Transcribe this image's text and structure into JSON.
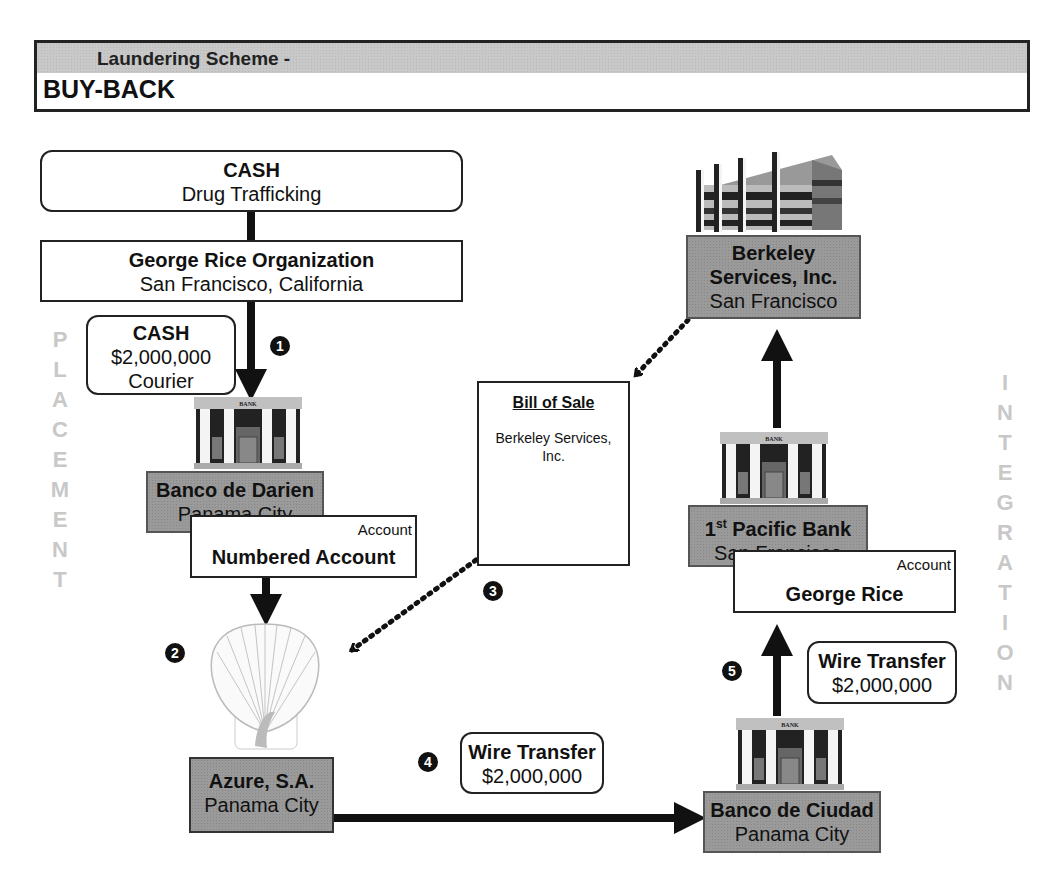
{
  "header": {
    "subtitle": "Laundering Scheme -",
    "title": "BUY-BACK"
  },
  "side_labels": {
    "left": [
      "P",
      "L",
      "A",
      "C",
      "E",
      "M",
      "E",
      "N",
      "T"
    ],
    "right": [
      "I",
      "N",
      "T",
      "E",
      "G",
      "R",
      "A",
      "T",
      "I",
      "O",
      "N"
    ],
    "left_word": "PLACEMENT",
    "right_word": "INTEGRATION"
  },
  "nodes": {
    "cash_source": {
      "title": "CASH",
      "subtitle": "Drug Trafficking"
    },
    "organization": {
      "title": "George Rice Organization",
      "subtitle": "San Francisco, California"
    },
    "cash_courier": {
      "title": "CASH",
      "amount": "$2,000,000",
      "method": "Courier"
    },
    "banco_darien": {
      "title": "Banco de Darien",
      "subtitle": "Panama City",
      "icon": "bank-building-icon"
    },
    "numbered_account": {
      "label": "Account",
      "title": "Numbered Account"
    },
    "azure": {
      "title": "Azure, S.A.",
      "subtitle": "Panama City",
      "icon": "shell-icon"
    },
    "bill_of_sale": {
      "title": "Bill of Sale",
      "body": "Berkeley Services, Inc."
    },
    "berkeley": {
      "title_line1": "Berkeley",
      "title_line2": "Services, Inc.",
      "subtitle": "San Francisco",
      "icon": "office-building-icon"
    },
    "pacific_bank": {
      "title_num": "1",
      "title_sup": "st",
      "title_rest": " Pacific Bank",
      "subtitle": "San Francisco",
      "icon": "bank-building-icon"
    },
    "george_account": {
      "label": "Account",
      "title": "George Rice"
    },
    "banco_ciudad": {
      "title": "Banco de Ciudad",
      "subtitle": "Panama City",
      "icon": "bank-building-icon"
    },
    "wire_transfer_4": {
      "title": "Wire Transfer",
      "amount": "$2,000,000"
    },
    "wire_transfer_5": {
      "title": "Wire Transfer",
      "amount": "$2,000,000"
    }
  },
  "steps": [
    "1",
    "2",
    "3",
    "4",
    "5"
  ],
  "bank_sign": "BANK"
}
